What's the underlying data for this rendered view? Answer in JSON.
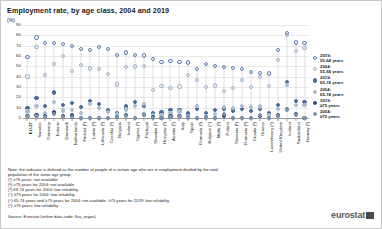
{
  "header": {
    "title": "Employment rate, by age class, 2004 and 2019",
    "unit": "(%)"
  },
  "legend": {
    "position": "right",
    "entries": [
      {
        "label": "2019:\n55-64 years",
        "color": "#5a7fb0",
        "style": "open-circle"
      },
      {
        "label": "2004:\n55-64 years",
        "color": "#9db3cc",
        "style": "open-circle"
      },
      {
        "label": "2019:\n65-74 years",
        "color": "#4a6d99",
        "style": "filled-circle"
      },
      {
        "label": "2004:\n65-74 years",
        "color": "#a9bcd2",
        "style": "filled-circle"
      },
      {
        "label": "2019:\n≥75 years",
        "color": "#2f4f74",
        "style": "filled-circle"
      },
      {
        "label": "2004:\n≥75 years",
        "color": "#7d93ad",
        "style": "filled-circle"
      }
    ]
  },
  "notes": [
    "Note: the indicator is defined as the number of people of a certain age who are in employment divided by the total",
    "population of the same age group.",
    "(¹) ≥75 years: not available.",
    "(²) ≥75 years for 2004: not available.",
    "(³) 65-74 years for 2004: low reliability.",
    "(⁴) ≥75 years for 2004: low reliability.",
    "(⁵) 65-74 years and ≥75 years for 2004: not available; ≥75 years for 2019: low reliability.",
    "(⁶) ≥75 years: low reliability."
  ],
  "source": "Source: Eurostat (online data code: lfsa_ergan)",
  "brand": "eurostat",
  "chart_data": {
    "type": "scatter",
    "title": "Employment rate, by age class, 2004 and 2019",
    "xlabel": "",
    "ylabel": "(%)",
    "ylim": [
      0,
      90
    ],
    "yticks": [
      0,
      10,
      20,
      30,
      40,
      50,
      60,
      70,
      80,
      90
    ],
    "grid": true,
    "categories": [
      "EU-27",
      "Sweden",
      "Germany",
      "Estonia",
      "Denmark",
      "Netherlands",
      "Finland (¹)",
      "Latvia (¹)",
      "Lithuania (¹)",
      "Czechia (¹)",
      "Bulgaria",
      "Ireland",
      "Cyprus (¹)",
      "Portugal",
      "Slovakia (²)",
      "Hungary (¹)",
      "Austria (³)",
      "Italy",
      "Spain",
      "Romania (¹)",
      "Belgium (⁴)",
      "Malta (¹)",
      "Poland",
      "Slovenia (¹)",
      "Romania (¹)",
      "Croatia (¹)",
      "Greece",
      "Luxembourg (⁵)",
      "United Kingdom",
      "Iceland",
      "Switzerland",
      "Norway (¹)"
    ],
    "series": [
      {
        "name": "2019: 55-64 years",
        "values": [
          59.1,
          77.9,
          72.7,
          72.5,
          71.8,
          69.7,
          66.8,
          65.5,
          68.4,
          66.7,
          60.7,
          63.3,
          61.1,
          60.4,
          57.0,
          54.4,
          54.8,
          54.3,
          53.8,
          47.8,
          52.1,
          50.1,
          49.5,
          48.6,
          47.8,
          44.2,
          43.2,
          43.1,
          66.0,
          82.4,
          73.1,
          72.6
        ]
      },
      {
        "name": "2004: 55-64 years",
        "values": [
          40.2,
          69.1,
          41.8,
          52.4,
          60.3,
          45.2,
          50.9,
          47.9,
          47.1,
          42.7,
          32.5,
          49.5,
          49.9,
          50.2,
          26.8,
          31.1,
          28.8,
          30.5,
          41.3,
          36.9,
          30.0,
          31.5,
          26.2,
          29.0,
          36.9,
          30.1,
          39.4,
          30.8,
          56.2,
          80.2,
          65.1,
          67.6
        ]
      },
      {
        "name": "2019: 65-74 years",
        "values": [
          10.0,
          19.5,
          11.8,
          24.6,
          12.3,
          14.5,
          10.5,
          16.7,
          13.3,
          8.0,
          5.0,
          11.2,
          15.1,
          12.0,
          4.7,
          5.3,
          7.9,
          7.9,
          4.3,
          8.5,
          4.5,
          7.4,
          8.7,
          7.2,
          8.5,
          6.7,
          8.8,
          4.6,
          12.9,
          35.0,
          16.5,
          15.6
        ]
      },
      {
        "name": "2004: 65-74 years",
        "values": [
          6.2,
          12.0,
          4.8,
          15.4,
          7.2,
          7.5,
          4.8,
          13.2,
          9.5,
          5.7,
          3.4,
          8.3,
          12.0,
          13.2,
          2.5,
          2.6,
          5.0,
          6.3,
          1.9,
          12.0,
          1.9,
          3.7,
          10.5,
          9.6,
          12.0,
          10.3,
          11.2,
          2.4,
          8.8,
          32.0,
          12.5,
          12.8
        ]
      },
      {
        "name": "2019: ≥75 years",
        "values": [
          2.1,
          3.1,
          2.0,
          5.4,
          1.7,
          2.5,
          0.0,
          0.0,
          0.0,
          0.0,
          0.9,
          2.6,
          0.0,
          2.6,
          0.8,
          0.0,
          1.4,
          1.6,
          0.6,
          0.0,
          0.7,
          0.0,
          2.5,
          0.0,
          0.0,
          0.0,
          1.8,
          0.0,
          2.4,
          8.9,
          3.6,
          0.0
        ]
      },
      {
        "name": "2004: ≥75 years",
        "values": [
          1.6,
          1.7,
          0.8,
          3.6,
          1.0,
          1.2,
          0.0,
          0.0,
          0.0,
          0.0,
          0.6,
          2.3,
          0.0,
          3.4,
          0.0,
          0.0,
          1.1,
          1.6,
          0.5,
          0.0,
          0.4,
          0.0,
          4.2,
          0.0,
          0.0,
          0.0,
          3.0,
          0.0,
          1.7,
          8.2,
          2.7,
          0.0
        ]
      }
    ]
  }
}
